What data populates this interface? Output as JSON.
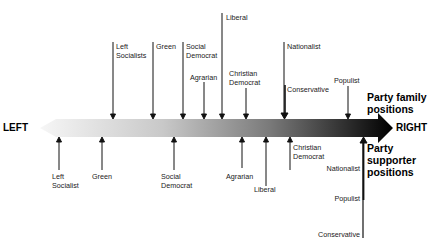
{
  "axis": {
    "left_label": "LEFT",
    "right_label": "RIGHT",
    "gradient_start": "#f4f4f4",
    "gradient_end": "#000000"
  },
  "groups": {
    "top_title": "Party family\npositions",
    "bottom_title": "Party\nsupporter\npositions"
  },
  "party_family_positions": [
    {
      "label": "Left\nSocialists",
      "x": 113,
      "top": 42
    },
    {
      "label": "Green",
      "x": 153,
      "top": 42
    },
    {
      "label": "Social\nDemocrat",
      "x": 183,
      "top": 42
    },
    {
      "label": "Agrarian",
      "x": 204,
      "top": 82
    },
    {
      "label": "Liberal",
      "x": 222,
      "top": 13
    },
    {
      "label": "Christian\nDemocrat",
      "x": 246,
      "top": 88
    },
    {
      "label": "Nationalist",
      "x": 284,
      "top": 42
    },
    {
      "label": "Conservative",
      "x": 285,
      "top": 85
    },
    {
      "label": "Populist",
      "x": 348,
      "top": 86
    }
  ],
  "party_supporter_positions": [
    {
      "label": "Left\nSocialist",
      "x": 59,
      "bottom": 170
    },
    {
      "label": "Green",
      "x": 102,
      "bottom": 170
    },
    {
      "label": "Social\nDemocrat",
      "x": 174,
      "bottom": 170
    },
    {
      "label": "Agrarian",
      "x": 242,
      "bottom": 168
    },
    {
      "label": "Liberal",
      "x": 266,
      "bottom": 186
    },
    {
      "label": "Christian\nDemocrat",
      "x": 290,
      "bottom": 170
    },
    {
      "label": "Nationalist",
      "x": 363,
      "bottom": 170
    },
    {
      "label": "Populist",
      "x": 363,
      "bottom": 200
    },
    {
      "label": "Conservative",
      "x": 363,
      "bottom": 238
    }
  ]
}
